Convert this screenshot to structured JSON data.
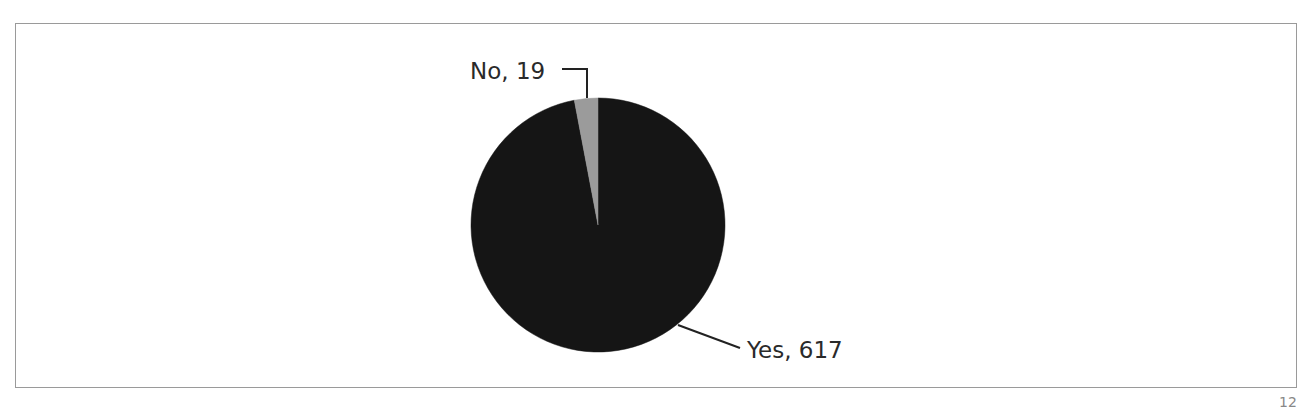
{
  "chart_data": {
    "type": "pie",
    "title": "",
    "slices": [
      {
        "label": "Yes",
        "value": 617,
        "color": "#151515",
        "display": "Yes, 617"
      },
      {
        "label": "No",
        "value": 19,
        "color": "#9b9b9b",
        "display": "No, 19"
      }
    ],
    "total": 636,
    "legend": "none",
    "data_labels": "outside with leader lines"
  },
  "page": {
    "number": "12"
  }
}
